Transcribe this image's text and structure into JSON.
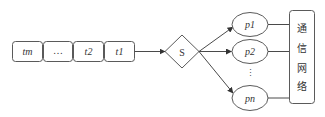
{
  "queue": {
    "items": [
      {
        "label": "tm"
      },
      {
        "label": "…"
      },
      {
        "label": "t2"
      },
      {
        "label": "t1"
      }
    ]
  },
  "scheduler": {
    "label": "S"
  },
  "processors": {
    "items": [
      {
        "label": "p1"
      },
      {
        "label": "p2"
      },
      {
        "label": "pn"
      }
    ],
    "ellipsis": "⋮"
  },
  "network": {
    "chars": [
      "通",
      "信",
      "网",
      "络"
    ]
  },
  "colors": {
    "stroke": "#5a5a5a",
    "text": "#333333",
    "background": "#ffffff"
  }
}
